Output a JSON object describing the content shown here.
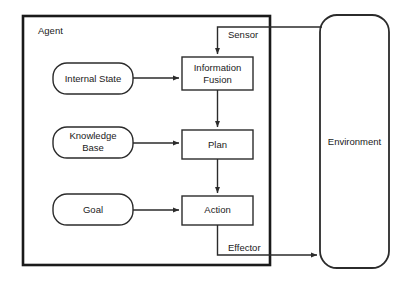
{
  "diagram": {
    "container": {
      "label": "Agent"
    },
    "nodes": [
      {
        "id": "internal-state",
        "label": "Internal State",
        "shape": "rounded"
      },
      {
        "id": "knowledge-base",
        "label_line1": "Knowledge",
        "label_line2": "Base",
        "shape": "rounded"
      },
      {
        "id": "goal",
        "label": "Goal",
        "shape": "rounded"
      },
      {
        "id": "information-fusion",
        "label_line1": "Information",
        "label_line2": "Fusion",
        "shape": "rect"
      },
      {
        "id": "plan",
        "label": "Plan",
        "shape": "rect"
      },
      {
        "id": "action",
        "label": "Action",
        "shape": "rect"
      },
      {
        "id": "environment",
        "label": "Environment",
        "shape": "stadium"
      }
    ],
    "edge_labels": {
      "sensor": "Sensor",
      "effector": "Effector"
    },
    "colors": {
      "background": "#ffffff",
      "stroke": "#2b2b2b",
      "container_stroke": "#1a1a1a",
      "text": "#1a1a1a"
    }
  }
}
